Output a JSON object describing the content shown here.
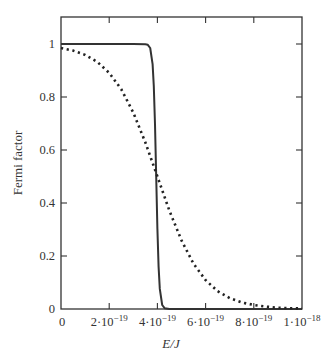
{
  "chart_data": {
    "type": "line",
    "title": "",
    "xlabel": "E/J",
    "ylabel": "Fermi factor",
    "xlim": [
      0,
      1e-18
    ],
    "ylim": [
      0,
      1.1
    ],
    "grid": false,
    "legend": null,
    "x_ticks": [
      {
        "value": 0,
        "label": "0"
      },
      {
        "value": 2e-19,
        "label": "2·10",
        "exp": "−19"
      },
      {
        "value": 4e-19,
        "label": "4·10",
        "exp": "−19"
      },
      {
        "value": 6e-19,
        "label": "6·10",
        "exp": "−19"
      },
      {
        "value": 8e-19,
        "label": "8·10",
        "exp": "−19"
      },
      {
        "value": 1e-18,
        "label": "1·10",
        "exp": "−18"
      }
    ],
    "y_ticks": [
      {
        "value": 0,
        "label": "0"
      },
      {
        "value": 0.2,
        "label": "0.2"
      },
      {
        "value": 0.4,
        "label": "0.4"
      },
      {
        "value": 0.6,
        "label": "0.6"
      },
      {
        "value": 0.8,
        "label": "0.8"
      },
      {
        "value": 1,
        "label": "1"
      }
    ],
    "x_unit_scale": 1e-19,
    "series": [
      {
        "name": "low temperature",
        "style": "solid",
        "color": "#333333",
        "x": [
          0,
          1,
          2,
          3,
          3.5,
          3.6,
          3.7,
          3.8,
          3.85,
          3.9,
          3.95,
          4.0,
          4.05,
          4.1,
          4.2,
          4.3,
          4.5,
          5,
          6,
          7,
          8,
          9,
          10
        ],
        "values": [
          1.0,
          1.0,
          1.0,
          1.0,
          0.999,
          0.997,
          0.985,
          0.924,
          0.841,
          0.697,
          0.5,
          0.303,
          0.159,
          0.076,
          0.015,
          0.003,
          0.0,
          0.0,
          0.0,
          0.0,
          0.0,
          0.0,
          0.0
        ]
      },
      {
        "name": "high temperature",
        "style": "dotted",
        "color": "#222222",
        "x": [
          0,
          0.5,
          1,
          1.5,
          2,
          2.5,
          3,
          3.5,
          4,
          4.5,
          5,
          5.5,
          6,
          6.5,
          7,
          7.5,
          8,
          8.5,
          9,
          9.5,
          10
        ],
        "values": [
          0.985,
          0.975,
          0.959,
          0.933,
          0.891,
          0.829,
          0.741,
          0.629,
          0.5,
          0.371,
          0.259,
          0.171,
          0.109,
          0.067,
          0.041,
          0.025,
          0.015,
          0.009,
          0.005,
          0.003,
          0.002
        ]
      }
    ]
  }
}
